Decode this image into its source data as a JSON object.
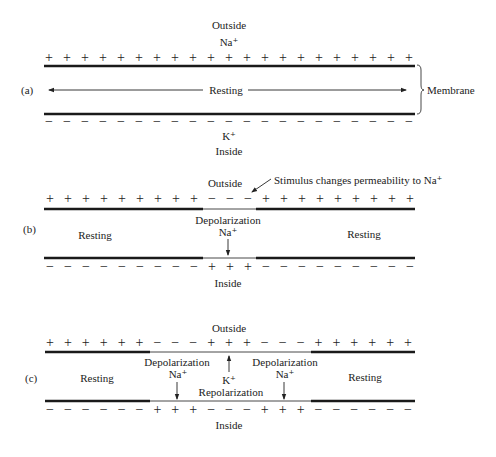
{
  "panels": {
    "a": {
      "label": "(a)",
      "outside_label": "Outside",
      "outside_ion": "Na⁺",
      "inside_label": "Inside",
      "inside_ion": "K⁺",
      "center_label": "Resting",
      "brace_label": "Membrane",
      "top_signs": "+++++++++++++++++++++",
      "bottom_signs": "−−−−−−−−−−−−−−−−−−−−−"
    },
    "b": {
      "label": "(b)",
      "outside_label": "Outside",
      "inside_label": "Inside",
      "stimulus_label": "Stimulus changes permeability to Na⁺",
      "left_label": "Resting",
      "right_label": "Resting",
      "center_label": "Depolarization",
      "center_ion": "Na⁺",
      "top_signs": "+++++++++−−−+++++++++",
      "bottom_signs": "−−−−−−−−−+++−−−−−−−−−"
    },
    "c": {
      "label": "(c)",
      "outside_label": "Outside",
      "inside_label": "Inside",
      "left_label": "Resting",
      "right_label": "Resting",
      "left_depol_label": "Depolarization",
      "left_depol_ion": "Na⁺",
      "right_depol_label": "Depolarization",
      "right_depol_ion": "Na⁺",
      "repol_ion": "K⁺",
      "repol_label": "Repolarization",
      "top_signs": "++++++−−−+++−−−++++++",
      "bottom_signs": "−−−−−−+++−−−+++−−−−−−"
    }
  }
}
